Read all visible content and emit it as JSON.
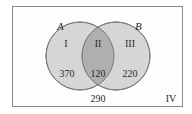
{
  "diagram": {
    "type": "venn",
    "sets": [
      {
        "name": "A",
        "label": "A"
      },
      {
        "name": "B",
        "label": "B"
      }
    ],
    "regions": [
      {
        "id": "I",
        "roman": "I",
        "value": "370",
        "description": "A only"
      },
      {
        "id": "II",
        "roman": "II",
        "value": "120",
        "description": "A and B"
      },
      {
        "id": "III",
        "roman": "III",
        "value": "220",
        "description": "B only"
      },
      {
        "id": "IV",
        "roman": "IV",
        "value": "290",
        "description": "neither A nor B"
      }
    ],
    "colors": {
      "circle_fill": "#d6d6d6",
      "intersection_fill": "#afafaf",
      "stroke": "#7a7a7a",
      "frame": "#8a8a8a"
    }
  }
}
